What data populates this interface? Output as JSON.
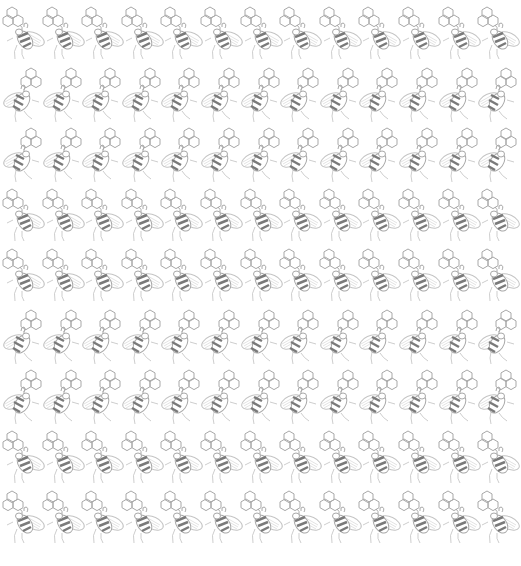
{
  "pattern": {
    "motif": "bee-with-honeycomb",
    "background": "#ffffff",
    "line_color": "#a8a8a8",
    "stripe_color": "#7a7a7a",
    "wing_color": "#c4c4c4",
    "columns": 13,
    "rows": 9,
    "col_pitch": 39.6,
    "row_pitch": 60.5,
    "first_col_x": 4,
    "first_row_y": 13,
    "row_variants": [
      "A",
      "B",
      "B",
      "A",
      "A",
      "B",
      "B",
      "A",
      "A"
    ]
  }
}
